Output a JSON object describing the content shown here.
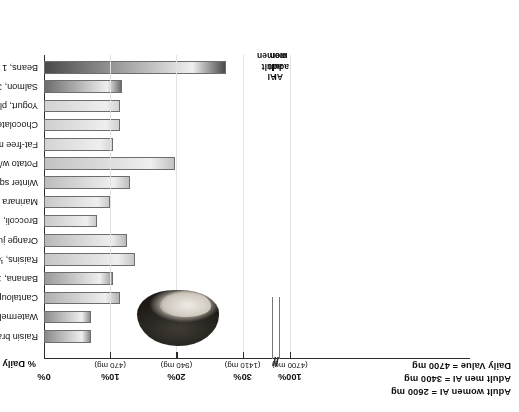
{
  "figure": {
    "orientation_note": "rotated-180",
    "axis_title": "% Daily Value",
    "axis_break_glyph": "//"
  },
  "notes": {
    "line1": "Adult women AI = 2600 mg",
    "line2": "Adult men AI = 3400 mg",
    "line3": "Daily Value = 4700 mg"
  },
  "reference_lines": [
    {
      "id": "ai-women",
      "l1": "AI",
      "l2": "adult",
      "l3": "women",
      "percent": 55.3
    },
    {
      "id": "ai-men",
      "l1": "AI",
      "l2": "adult",
      "l3": "men",
      "percent": 72.3
    }
  ],
  "photo": {
    "name": "potato-photo",
    "alt_text": "Potato"
  },
  "chart_data": {
    "type": "bar",
    "orientation": "horizontal",
    "title": "",
    "xlabel": "% Daily Value",
    "ylabel": "",
    "xlim": [
      0,
      100
    ],
    "grid": true,
    "legend": [
      "Adult women AI = 2600 mg",
      "Adult men AI = 3400 mg",
      "Daily Value = 4700 mg"
    ],
    "axis_ticks": [
      {
        "label": "0%",
        "sub": "",
        "value": 0
      },
      {
        "label": "10%",
        "sub": "(470 mg)",
        "value": 10
      },
      {
        "label": "20%",
        "sub": "(940 mg)",
        "value": 20
      },
      {
        "label": "30%",
        "sub": "(1410 mg)",
        "value": 30
      },
      {
        "label": "100%",
        "sub": "(4700 mg)",
        "value": 100
      }
    ],
    "categories": [
      "Beans, 1 cup",
      "Salmon, 3 oz",
      "Yogurt, plain, 1 cup",
      "Chocolate milk, 1 cup",
      "Fat-free milk, 1 cup",
      "Potato w/skin, 1 medium",
      "Winter squash, baked, 1 cup",
      "Marinara sauce, ½ cup",
      "Broccoli, 1 cup",
      "Orange juice, fresh squeezed, 1 cup",
      "Raisins, ½ cup",
      "Banana, 1 medium",
      "Cantaloupe, 1 cup",
      "Watermelon, 1 wedge",
      "Raisin bran cereal, 1 cup"
    ],
    "values": [
      27.5,
      11.8,
      11.5,
      11.5,
      10.5,
      19.8,
      13.0,
      10.0,
      8.0,
      12.5,
      13.8,
      10.5,
      11.5,
      7.1,
      7.1
    ]
  },
  "bar_shades": [
    "#4a4a4a",
    "#6d6d6d",
    "#d2d2d2",
    "#cfcfcf",
    "#d4d4d4",
    "#c2c2c2",
    "#bdbdbd",
    "#c9c9c9",
    "#cacaca",
    "#b9b9b9",
    "#c6c6c6",
    "#9b9b9b",
    "#b0b0b0",
    "#8e8e8e",
    "#8a8a8a"
  ]
}
